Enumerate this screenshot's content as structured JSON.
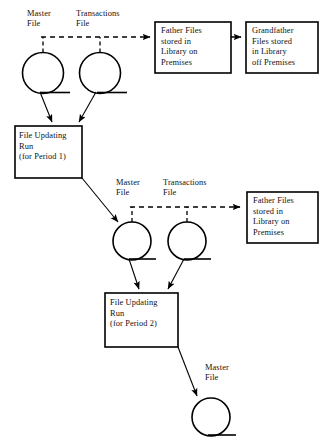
{
  "diagram": {
    "colors": {
      "background": "#ffffff",
      "stroke": "#000000",
      "text": "#111111"
    },
    "labels": {
      "master_file_1": "Master\nFile",
      "transactions_file_1": "Transactions\nFile",
      "master_file_2": "Master\nFile",
      "transactions_file_2": "Transactions\nFile",
      "master_file_3": "Master\nFile"
    },
    "boxes": {
      "father_files_1": "Father Files\nstored in\nLibrary on\nPremises",
      "grandfather_files": "Grandfather\nFiles stored\nin Library\noff Premises",
      "father_files_2": "Father Files\nstored in\nLibrary on\nPremises",
      "file_updating_run_1": "File Updating\nRun\n(for Period 1)",
      "file_updating_run_2": "File Updating\nRun\n(for Period 2)"
    },
    "shapes": {
      "tape_symbol_name": "magnetic-tape-symbol",
      "process_symbol_name": "process-box",
      "annotation_symbol_name": "dashed-annotation-connector"
    }
  }
}
